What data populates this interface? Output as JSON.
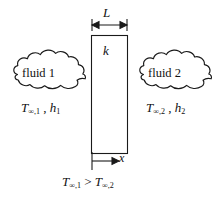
{
  "figure": {
    "colors": {
      "line": "#1a1a1a",
      "text": "#111111",
      "background": "#ffffff",
      "wall_fill": "#ffffff"
    }
  },
  "wall": {
    "thickness_label": "L",
    "conductivity_label": "k"
  },
  "axis": {
    "label": "x"
  },
  "left_side": {
    "cloud_label": "fluid 1",
    "temperature_symbol": "T",
    "temperature_subscript": "∞,1",
    "separator": " , ",
    "coefficient_symbol": "h",
    "coefficient_subscript": "1"
  },
  "right_side": {
    "cloud_label": "fluid 2",
    "temperature_symbol": "T",
    "temperature_subscript": "∞,2",
    "separator": " , ",
    "coefficient_symbol": "h",
    "coefficient_subscript": "2"
  },
  "inequality": {
    "left_symbol": "T",
    "left_subscript": "∞,1",
    "operator": " > ",
    "right_symbol": "T",
    "right_subscript": "∞,2"
  }
}
